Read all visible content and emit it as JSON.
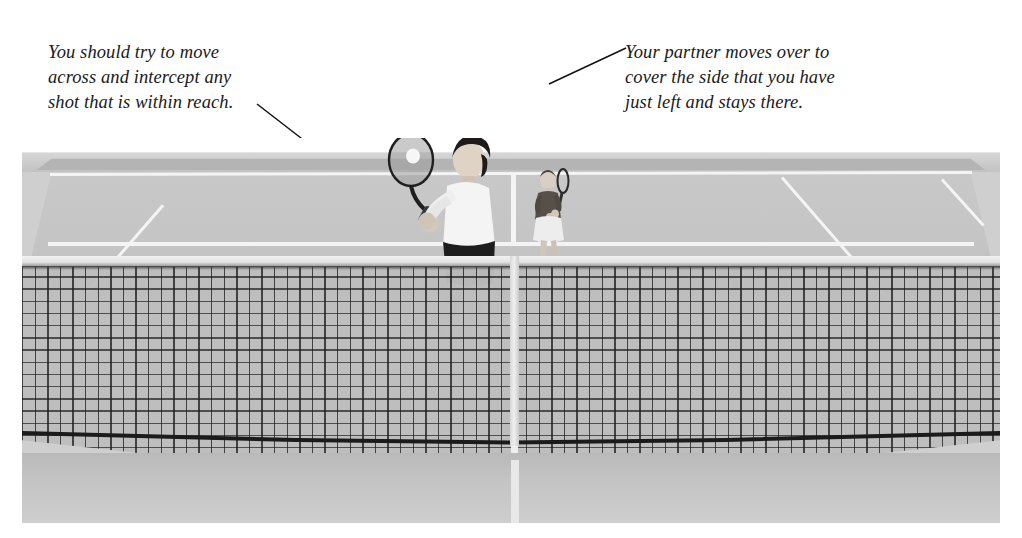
{
  "figure": {
    "type": "instructional-photograph",
    "background_color": "#ffffff"
  },
  "captions": {
    "left": {
      "text": "You should try to move\nacross and intercept any\nshot that is within reach.",
      "points_to": "near-player-racquet"
    },
    "right": {
      "text": "Your partner moves over to\ncover the side that you have\njust left and stays there.",
      "points_to": "far-player-racquet"
    }
  },
  "scene": {
    "court": {
      "surface_color": "#c6c6c6",
      "line_color": "#f4f4f4",
      "near_surface_color": "#c4c4c4",
      "back_wall_color": "#c2c2c2"
    },
    "net": {
      "headband_color": "#e9e9e9",
      "mesh_color": "#1b1b1b",
      "bottom_band_color": "#1b1b1b",
      "center_strap_color": "#e2e2e2"
    },
    "players": [
      {
        "role": "near-player",
        "description": "boy hitting a backhand volley at the net",
        "shirt_color": "#f2f2f2",
        "shorts_color": "#1d1d1d",
        "shoe_color": "#f5f5f5",
        "hair_color": "#242424",
        "has_racquet": true,
        "has_ball": true
      },
      {
        "role": "far-player",
        "description": "partner standing at the far baseline facing forward with racquet up",
        "shirt_color": "#4a4a4a",
        "skirt_color": "#ededed",
        "shoe_color": "#f2f2f2",
        "hair_color": "#3b3b3b",
        "has_racquet": true,
        "has_ball": false
      }
    ]
  }
}
